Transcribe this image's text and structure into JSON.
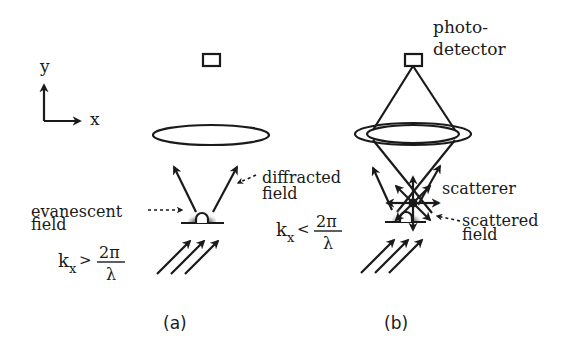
{
  "axes": {
    "y_label": "y",
    "x_label": "x"
  },
  "panel_a": {
    "caption": "(a)",
    "label_diffracted_line1": "diffracted",
    "label_diffracted_line2": "field",
    "label_evanescent_line1": "evanescent",
    "label_evanescent_line2": "field",
    "condition_k": "k",
    "condition_sub": "x",
    "condition_op": ">",
    "condition_num": "2π",
    "condition_den": "λ"
  },
  "panel_b": {
    "caption": "(b)",
    "label_detector_line1": "photo-",
    "label_detector_line2": "detector",
    "label_scatterer": "scatterer",
    "label_scattered_line1": "scattered",
    "label_scattered_line2": "field",
    "label_diffracted_line1": "diffracted",
    "label_diffracted_line2": "field",
    "condition_k": "k",
    "condition_sub": "x",
    "condition_op": "<",
    "condition_num": "2π",
    "condition_den": "λ"
  },
  "colors": {
    "ink": "#1a1a1a",
    "halo": "#8a8a8a",
    "background": "#ffffff"
  }
}
